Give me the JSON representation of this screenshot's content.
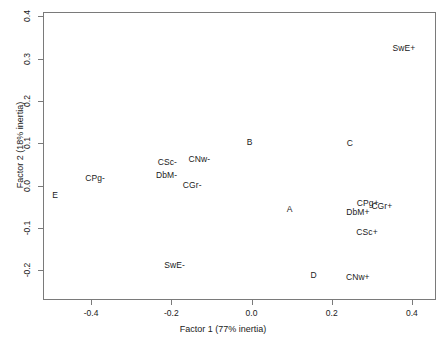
{
  "chart_data": {
    "type": "scatter",
    "title": "",
    "xlabel": "Factor 1 (77% inertia)",
    "ylabel": "Factor 2 (18% inertia)",
    "xlim": [
      -0.52,
      0.46
    ],
    "ylim": [
      -0.27,
      0.41
    ],
    "xticks": [
      -0.4,
      -0.2,
      0.0,
      0.2,
      0.4
    ],
    "xticklabels": [
      "-0.4",
      "-0.2",
      "0.0",
      "0.2",
      "0.4"
    ],
    "yticks": [
      -0.2,
      -0.1,
      0.0,
      0.1,
      0.2,
      0.3,
      0.4
    ],
    "yticklabels": [
      "-0.2",
      "-0.1",
      "0.0",
      "0.1",
      "0.2",
      "0.3",
      "0.4"
    ],
    "grid": false,
    "legend": false,
    "marker": "text-label",
    "points": [
      {
        "label": "SwE+",
        "x": 0.38,
        "y": 0.325
      },
      {
        "label": "B",
        "x": -0.005,
        "y": 0.102
      },
      {
        "label": "C",
        "x": 0.245,
        "y": 0.1
      },
      {
        "label": "CSc-",
        "x": -0.21,
        "y": 0.057
      },
      {
        "label": "CNw-",
        "x": -0.13,
        "y": 0.062
      },
      {
        "label": "DbM-",
        "x": -0.212,
        "y": 0.026
      },
      {
        "label": "CPg-",
        "x": -0.39,
        "y": 0.018
      },
      {
        "label": "CGr-",
        "x": -0.148,
        "y": 0.002
      },
      {
        "label": "E",
        "x": -0.49,
        "y": -0.022
      },
      {
        "label": "A",
        "x": 0.095,
        "y": -0.055
      },
      {
        "label": "CPg+",
        "x": 0.29,
        "y": -0.042
      },
      {
        "label": "CGr+",
        "x": 0.325,
        "y": -0.048
      },
      {
        "label": "DbM+",
        "x": 0.265,
        "y": -0.062
      },
      {
        "label": "CSc+",
        "x": 0.288,
        "y": -0.11
      },
      {
        "label": "SwE-",
        "x": -0.192,
        "y": -0.188
      },
      {
        "label": "D",
        "x": 0.155,
        "y": -0.212
      },
      {
        "label": "CNw+",
        "x": 0.265,
        "y": -0.215
      }
    ]
  }
}
